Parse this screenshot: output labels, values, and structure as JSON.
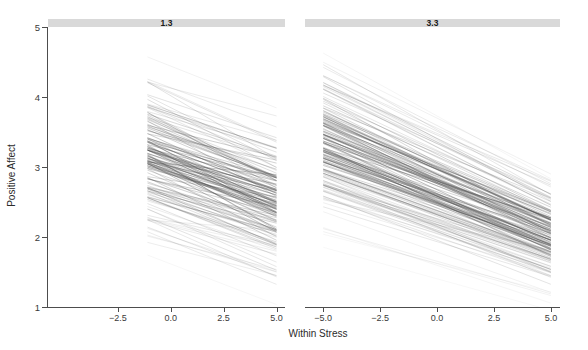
{
  "chart_data": {
    "type": "line",
    "title": "",
    "subtitle": "",
    "xlabel": "Within Stress",
    "ylabel": "Positive Affect",
    "xlim": [
      -5.8,
      5.4
    ],
    "ylim": [
      1,
      5
    ],
    "grid": false,
    "legend": false,
    "legend_position": "none",
    "facet_variable": "Between Stress",
    "facets": [
      {
        "label": "1.3",
        "x_ticks": [
          -2.5,
          0.0,
          2.5,
          5.0
        ],
        "x_tick_labels": [
          "-2.5",
          "0.0",
          "2.5",
          "5.0"
        ],
        "x_data_range": [
          -1.1,
          5.0
        ],
        "n_lines": 140,
        "description": "Random-slope spaghetti lines, all negative slope; intercepts spread from about 1.55 to 4.75 at x=-1.1 and from about 1.05 to 3.95 at x=5.0",
        "intercept_range_at_xmin": [
          1.55,
          4.78
        ],
        "intercept_range_at_xmax": [
          1.02,
          3.95
        ],
        "slope_mean": -0.14,
        "slope_range": [
          -0.06,
          -0.22
        ]
      },
      {
        "label": "3.3",
        "x_ticks": [
          -5.0,
          -2.5,
          0.0,
          2.5,
          5.0
        ],
        "x_tick_labels": [
          "-5.0",
          "-2.5",
          "0.0",
          "2.5",
          "5.0"
        ],
        "x_data_range": [
          -5.0,
          5.0
        ],
        "n_lines": 150,
        "description": "Random-slope spaghetti lines, all negative slope spanning the full x range; values fall from about 4.85 down to about 1.0",
        "intercept_range_at_xmin": [
          1.85,
          4.88
        ],
        "intercept_range_at_xmax": [
          1.0,
          3.05
        ],
        "slope_mean": -0.17,
        "slope_range": [
          -0.08,
          -0.26
        ]
      }
    ],
    "y_ticks": [
      1,
      2,
      3,
      4,
      5
    ],
    "y_tick_labels": [
      "1",
      "2",
      "3",
      "4",
      "5"
    ],
    "series_color": "#4d4d4d",
    "strip_background_color": "#d9d9d9",
    "panel_background_color": "#ffffff",
    "axis_color": "#4d4d4d"
  },
  "axis": {
    "y_label": "Positive Affect",
    "x_label": "Within Stress",
    "y_ticks": [
      "5",
      "4",
      "3",
      "2",
      "1"
    ],
    "left_x_ticks": [
      "-2.5",
      "0.0",
      "2.5",
      "5.0"
    ],
    "right_x_ticks": [
      "-5.0",
      "-2.5",
      "0.0",
      "2.5",
      "5.0"
    ]
  },
  "strips": {
    "left_label": "1.3",
    "right_label": "3.3"
  }
}
